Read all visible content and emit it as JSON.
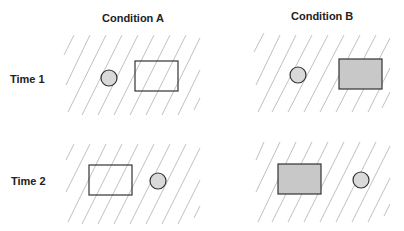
{
  "figure": {
    "columns": [
      {
        "label": "Condition A"
      },
      {
        "label": "Condition B"
      }
    ],
    "rows": [
      {
        "label": "Time 1"
      },
      {
        "label": "Time 2"
      }
    ],
    "panels": [
      {
        "row": "Time 1",
        "condition": "Condition A",
        "circle": "left",
        "rectangle": "right",
        "rectangle_fill": "none"
      },
      {
        "row": "Time 1",
        "condition": "Condition B",
        "circle": "left",
        "rectangle": "right",
        "rectangle_fill": "gray"
      },
      {
        "row": "Time 2",
        "condition": "Condition A",
        "circle": "right",
        "rectangle": "left",
        "rectangle_fill": "none"
      },
      {
        "row": "Time 2",
        "condition": "Condition B",
        "circle": "right",
        "rectangle": "left",
        "rectangle_fill": "gray"
      }
    ],
    "colors": {
      "stroke": "#333333",
      "circle_fill": "#d9d9d9",
      "rect_fill_gray": "#c8c8c8",
      "hatch": "#b0b0b0",
      "text": "#222222"
    }
  }
}
